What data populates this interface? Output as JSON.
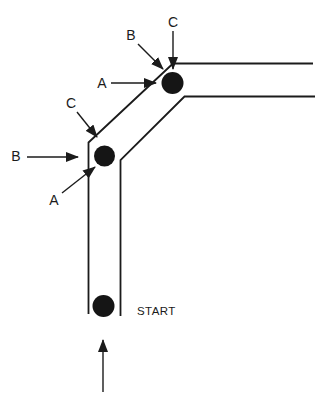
{
  "figure": {
    "background_color": "#ffffff",
    "ink_color": "#1b1b1b",
    "start_label": "START",
    "upper_annotations": {
      "a": "A",
      "b": "B",
      "c": "C"
    },
    "lower_annotations": {
      "a": "A",
      "b": "B",
      "c": "C"
    }
  }
}
